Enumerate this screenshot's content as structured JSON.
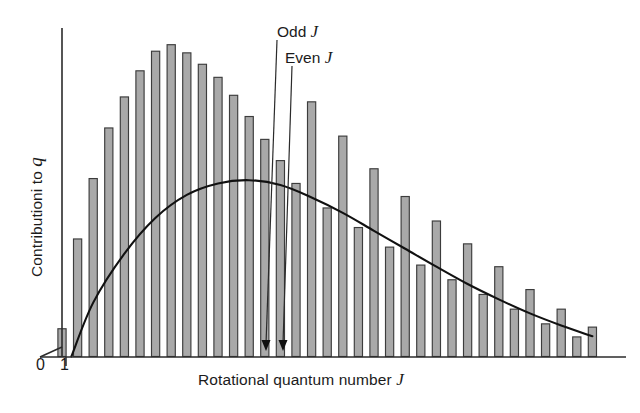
{
  "figure": {
    "background": "#ffffff",
    "bar_fill": "#a9a9a9",
    "bar_stroke": "#3c3c3c",
    "curve_color": "#111111",
    "axis_color": "#2b2b2b"
  },
  "axes": {
    "x_label_text": "Rotational quantum number ",
    "x_label_symbol": "J",
    "y_label_text": "Contributioni to ",
    "y_label_symbol": "q",
    "x_ticks": [
      "0",
      "1"
    ]
  },
  "annotations": {
    "odd_text": "Odd ",
    "odd_symbol": "J",
    "even_text": "Even ",
    "even_symbol": "J"
  },
  "chart_data": {
    "type": "bar",
    "title": "",
    "xlabel": "Rotational quantum number J",
    "ylabel": "Contributioni to q",
    "grid": false,
    "legend": "none",
    "xlim": [
      0,
      35
    ],
    "ylim": [
      0,
      1.0
    ],
    "x_tick_labels": [
      "0",
      "1"
    ],
    "x_tick_values": [
      0,
      1
    ],
    "note": "Bar heights are relative contributions of each rotational level J to the rotational partition function; alternating odd/even J levels carry different nuclear-spin statistical weights, producing the sawtooth pattern at higher J. The smooth curve is the classical (continuum) envelope.",
    "annotated_points": [
      {
        "label": "Odd J",
        "J": 15
      },
      {
        "label": "Even J",
        "J": 16
      }
    ],
    "categories": [
      0,
      1,
      2,
      3,
      4,
      5,
      6,
      7,
      8,
      9,
      10,
      11,
      12,
      13,
      14,
      15,
      16,
      17,
      18,
      19,
      20,
      21,
      22,
      23,
      24,
      25,
      26,
      27,
      28,
      29,
      30,
      31,
      32,
      33,
      34
    ],
    "series": [
      {
        "name": "Contribution to q",
        "values": [
          0.085,
          0.36,
          0.545,
          0.7,
          0.795,
          0.875,
          0.935,
          0.955,
          0.93,
          0.895,
          0.855,
          0.8,
          0.735,
          0.665,
          0.6,
          0.53,
          0.78,
          0.455,
          0.675,
          0.395,
          0.575,
          0.335,
          0.49,
          0.28,
          0.415,
          0.235,
          0.345,
          0.19,
          0.275,
          0.145,
          0.205,
          0.1,
          0.145,
          0.06,
          0.09
        ]
      },
      {
        "name": "Classical envelope",
        "type": "line",
        "x": [
          0.6,
          2,
          4,
          6,
          8,
          10,
          12,
          14,
          16,
          18,
          20,
          22,
          24,
          26,
          28,
          30,
          32,
          34
        ],
        "values": [
          0.0,
          0.165,
          0.315,
          0.425,
          0.495,
          0.53,
          0.54,
          0.525,
          0.487,
          0.44,
          0.385,
          0.33,
          0.275,
          0.222,
          0.175,
          0.132,
          0.095,
          0.062
        ]
      }
    ]
  }
}
